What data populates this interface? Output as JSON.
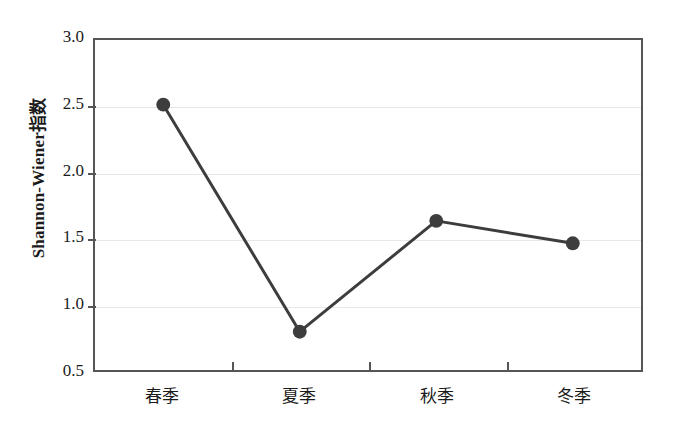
{
  "chart_data": {
    "type": "line",
    "title": "",
    "xlabel": "",
    "ylabel": "Shannon-Wiener指数",
    "categories": [
      "春季",
      "夏季",
      "秋季",
      "冬季"
    ],
    "values": [
      2.51,
      0.79,
      1.63,
      1.46
    ],
    "series": [
      {
        "name": "Shannon-Wiener指数",
        "values": [
          2.51,
          0.79,
          1.63,
          1.46
        ]
      }
    ],
    "ylim": [
      0.5,
      3.0
    ],
    "yticks": [
      3.0,
      2.5,
      2.0,
      1.5,
      1.0,
      0.5
    ],
    "ytick_labels": [
      "3.0",
      "2.5",
      "2.0",
      "1.5",
      "1.0",
      "0.5"
    ],
    "grid": "horizontal",
    "legend": "none",
    "marker": "filled-circle",
    "colors": {
      "line": "#3d3d3d",
      "marker": "#3d3d3d",
      "grid": "#e8e8e8",
      "frame": "#555555",
      "text": "#1b1b1b",
      "background": "#ffffff"
    }
  }
}
